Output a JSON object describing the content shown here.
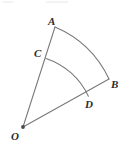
{
  "figure": {
    "kind": "geometry-diagram",
    "background_color": "#ffffff",
    "stroke_color": "#77777a",
    "label_color": "#2b2b2d",
    "vertex_dot_color": "#4a4a4e",
    "labels": {
      "a": "A",
      "b": "B",
      "c": "C",
      "d": "D",
      "o": "O"
    },
    "points": {
      "o": {
        "x": 23,
        "y": 127
      },
      "a": {
        "x": 55,
        "y": 27
      },
      "b": {
        "x": 109,
        "y": 79
      },
      "c": {
        "x": 46.0,
        "y": 58.4
      },
      "d": {
        "x": 88.4,
        "y": 96.3
      }
    },
    "rays": [
      {
        "name": "ray-OA",
        "from": "o",
        "to": "a"
      },
      {
        "name": "ray-OB",
        "from": "o",
        "to": "b"
      }
    ],
    "arcs": [
      {
        "name": "outer-arc-AB",
        "from": "a",
        "to": "b",
        "radius": 105,
        "center": "o"
      },
      {
        "name": "inner-arc-CD",
        "from": "c",
        "to": "d",
        "radius": 71.5,
        "center": "o"
      }
    ]
  }
}
